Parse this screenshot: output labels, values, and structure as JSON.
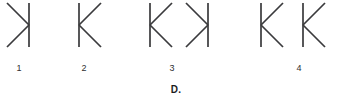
{
  "figure": {
    "caption": "D.",
    "background_color": "#ffffff",
    "stroke_color": "#3a3a3c",
    "label_color": "#2f2f31",
    "groups": [
      {
        "number": "1",
        "label_x": 19,
        "group_x": 4,
        "glyphs": [
          {
            "form": "mirrored-k",
            "x": 0
          }
        ]
      },
      {
        "number": "2",
        "label_x": 84,
        "group_x": 74,
        "glyphs": [
          {
            "form": "k",
            "x": 0
          }
        ]
      },
      {
        "number": "3",
        "label_x": 172,
        "group_x": 145,
        "glyphs": [
          {
            "form": "k",
            "x": 0
          },
          {
            "form": "mirrored-k",
            "x": 38
          }
        ]
      },
      {
        "number": "4",
        "label_x": 299,
        "group_x": 256,
        "glyphs": [
          {
            "form": "k",
            "x": 0
          },
          {
            "form": "mirrored-k",
            "x": 42
          }
        ]
      }
    ]
  }
}
